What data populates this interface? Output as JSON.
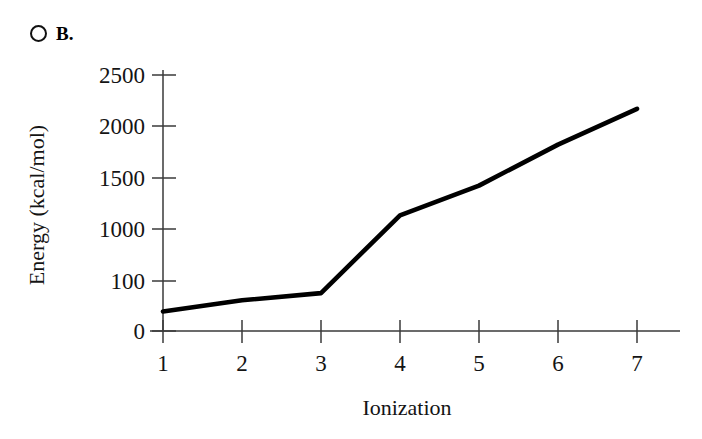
{
  "option": {
    "radio_name": "radio-unselected-icon",
    "letter": "B.",
    "selected": false
  },
  "chart_data": {
    "type": "line",
    "title": "",
    "xlabel": "Ionization",
    "ylabel": "Energy (kcal/mol)",
    "x": [
      1,
      2,
      3,
      4,
      5,
      6,
      7
    ],
    "xtick_labels": [
      "1",
      "2",
      "3",
      "4",
      "5",
      "6",
      "7"
    ],
    "ytick_labels": [
      "0",
      "100",
      "1000",
      "1500",
      "2000",
      "2500"
    ],
    "ytick_positions": [
      0,
      500,
      1000,
      1500,
      2000,
      2500
    ],
    "values": [
      190,
      300,
      370,
      1130,
      1420,
      1820,
      2170
    ],
    "series": [
      {
        "name": "Ionization energy",
        "values": [
          190,
          300,
          370,
          1130,
          1420,
          1820,
          2170
        ],
        "color": "#000000"
      }
    ],
    "xlim": [
      1,
      7
    ],
    "ylim": [
      0,
      2500
    ],
    "grid": false,
    "legend": "none",
    "note": "Second y-axis tick is labeled 100 although it sits at the 500 gridline position."
  },
  "colors": {
    "line": "#000000",
    "axis": "#3a3a3a",
    "text": "#141414",
    "background": "#ffffff"
  }
}
